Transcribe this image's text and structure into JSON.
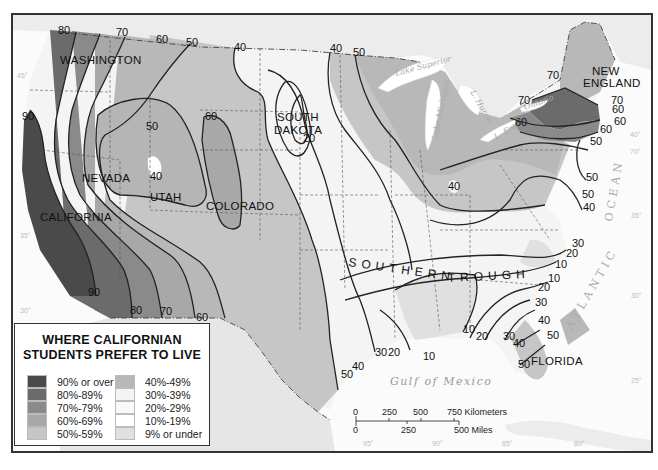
{
  "map": {
    "title_line1": "WHERE CALIFORNIAN",
    "title_line2": "STUDENTS PREFER TO LIVE",
    "legend": {
      "left": [
        {
          "label": "90% or over",
          "color": "#4a4a4a"
        },
        {
          "label": "80%-89%",
          "color": "#6b6b6b"
        },
        {
          "label": "70%-79%",
          "color": "#8a8a8a"
        },
        {
          "label": "60%-69%",
          "color": "#a8a8a8"
        },
        {
          "label": "50%-59%",
          "color": "#c6c6c6"
        }
      ],
      "right": [
        {
          "label": "40%-49%",
          "color": "#b8b8b8"
        },
        {
          "label": "30%-39%",
          "color": "#f4f4f4"
        },
        {
          "label": "20%-29%",
          "color": "#f9f9f9"
        },
        {
          "label": "10%-19%",
          "color": "#ffffff"
        },
        {
          "label": "9% or under",
          "color": "#e0e0e0"
        }
      ]
    },
    "regions": {
      "washington": "WASHINGTON",
      "nevada": "NEVADA",
      "utah": "UTAH",
      "colorado": "COLORADO",
      "california": "CALIFORNIA",
      "south_dakota_1": "SOUTH",
      "south_dakota_2": "DAKOTA",
      "new_england_1": "NEW",
      "new_england_2": "ENGLAND",
      "florida": "FLORIDA",
      "southern": "SOUTHERN",
      "trough": "TROUGH"
    },
    "water": {
      "lake_superior": "Lake Superior",
      "lake_michigan": "Lake Michigan",
      "lake_huron": "L. Huron",
      "lake_erie": "L. Erie",
      "lake_ontario": "Ontario",
      "gulf": "Gulf of Mexico",
      "atlantic": "ATLANTIC",
      "ocean": "OCEAN"
    },
    "isoline_labels": [
      {
        "text": "80",
        "x": 58,
        "y": 34
      },
      {
        "text": "70",
        "x": 116,
        "y": 36
      },
      {
        "text": "60",
        "x": 156,
        "y": 43
      },
      {
        "text": "50",
        "x": 186,
        "y": 46
      },
      {
        "text": "40",
        "x": 234,
        "y": 51
      },
      {
        "text": "40",
        "x": 330,
        "y": 52
      },
      {
        "text": "50",
        "x": 353,
        "y": 56
      },
      {
        "text": "90",
        "x": 22,
        "y": 120
      },
      {
        "text": "50",
        "x": 146,
        "y": 130
      },
      {
        "text": "60",
        "x": 205,
        "y": 120
      },
      {
        "text": "20",
        "x": 303,
        "y": 142
      },
      {
        "text": "40",
        "x": 150,
        "y": 180
      },
      {
        "text": "40",
        "x": 448,
        "y": 190
      },
      {
        "text": "70",
        "x": 547,
        "y": 79
      },
      {
        "text": "70",
        "x": 518,
        "y": 104
      },
      {
        "text": "60",
        "x": 515,
        "y": 126
      },
      {
        "text": "70",
        "x": 611,
        "y": 104
      },
      {
        "text": "60",
        "x": 612,
        "y": 113
      },
      {
        "text": "60",
        "x": 614,
        "y": 125
      },
      {
        "text": "60",
        "x": 600,
        "y": 133
      },
      {
        "text": "50",
        "x": 590,
        "y": 145
      },
      {
        "text": "50",
        "x": 586,
        "y": 181
      },
      {
        "text": "50",
        "x": 582,
        "y": 198
      },
      {
        "text": "40",
        "x": 583,
        "y": 211
      },
      {
        "text": "30",
        "x": 572,
        "y": 247
      },
      {
        "text": "20",
        "x": 566,
        "y": 257
      },
      {
        "text": "10",
        "x": 555,
        "y": 268
      },
      {
        "text": "10",
        "x": 548,
        "y": 282
      },
      {
        "text": "20",
        "x": 538,
        "y": 291
      },
      {
        "text": "30",
        "x": 535,
        "y": 306
      },
      {
        "text": "40",
        "x": 538,
        "y": 324
      },
      {
        "text": "50",
        "x": 547,
        "y": 339
      },
      {
        "text": "40",
        "x": 513,
        "y": 347
      },
      {
        "text": "30",
        "x": 503,
        "y": 340
      },
      {
        "text": "50",
        "x": 518,
        "y": 368
      },
      {
        "text": "10",
        "x": 463,
        "y": 333
      },
      {
        "text": "20",
        "x": 476,
        "y": 340
      },
      {
        "text": "10",
        "x": 423,
        "y": 360
      },
      {
        "text": "30",
        "x": 375,
        "y": 356
      },
      {
        "text": "20",
        "x": 388,
        "y": 356
      },
      {
        "text": "40",
        "x": 352,
        "y": 370
      },
      {
        "text": "50",
        "x": 341,
        "y": 378
      },
      {
        "text": "90",
        "x": 88,
        "y": 296
      },
      {
        "text": "80",
        "x": 130,
        "y": 314
      },
      {
        "text": "70",
        "x": 160,
        "y": 315
      },
      {
        "text": "60",
        "x": 196,
        "y": 321
      }
    ],
    "degree_labels": [
      {
        "text": "45°",
        "x": 17,
        "y": 78
      },
      {
        "text": "35°",
        "x": 20,
        "y": 238
      },
      {
        "text": "30°",
        "x": 20,
        "y": 313
      },
      {
        "text": "40°",
        "x": 630,
        "y": 137
      },
      {
        "text": "70°",
        "x": 630,
        "y": 154
      },
      {
        "text": "35°",
        "x": 631,
        "y": 218
      },
      {
        "text": "30°",
        "x": 631,
        "y": 298
      },
      {
        "text": "25°",
        "x": 631,
        "y": 383
      },
      {
        "text": "95°",
        "x": 363,
        "y": 446
      },
      {
        "text": "90°",
        "x": 432,
        "y": 446
      },
      {
        "text": "85°",
        "x": 502,
        "y": 446
      },
      {
        "text": "80°",
        "x": 574,
        "y": 446
      }
    ],
    "scale_bar": {
      "km_ticks": [
        "0",
        "250",
        "500",
        "750 Kilometers"
      ],
      "mi_ticks": [
        "0",
        "250",
        "500 Miles"
      ]
    }
  }
}
